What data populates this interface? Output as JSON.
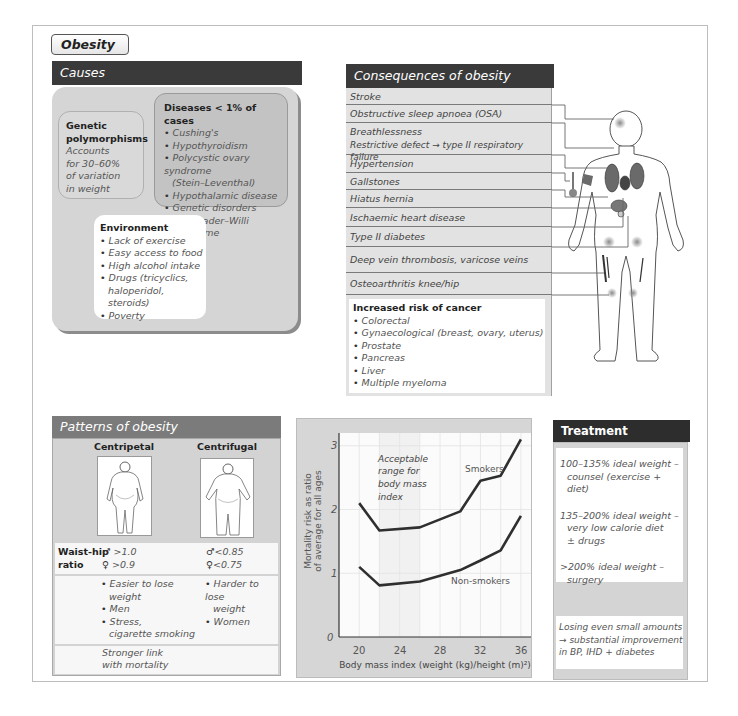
{
  "title": "Obesity",
  "causes": {
    "header": "Causes",
    "genetic": {
      "title_lines": [
        "Genetic",
        "polymorphisms"
      ],
      "body_lines": [
        "Accounts",
        "for 30–60%",
        "of variation",
        "in weight"
      ]
    },
    "diseases": {
      "title": "Diseases < 1% of cases",
      "items": [
        {
          "text": "Cushing's"
        },
        {
          "text": "Hypothyroidism"
        },
        {
          "text": "Polycystic ovary syndrome",
          "sub": "(Stein–Leventhal)"
        },
        {
          "text": "Hypothalamic disease"
        },
        {
          "text": "Genetic disorders",
          "sub": "e.g. Prader–Willi syndrome"
        }
      ]
    },
    "environment": {
      "title": "Environment",
      "items": [
        {
          "text": "Lack of exercise"
        },
        {
          "text": "Easy access to food"
        },
        {
          "text": "High alcohol intake"
        },
        {
          "text": "Drugs (tricyclics,",
          "sub": "haloperidol, steroids)"
        },
        {
          "text": "Poverty"
        }
      ]
    }
  },
  "consequences": {
    "header": "Consequences of obesity",
    "items": [
      {
        "lines": [
          "Stroke"
        ]
      },
      {
        "lines": [
          "Obstructive sleep apnoea (OSA)"
        ]
      },
      {
        "lines": [
          "Breathlessness",
          "Restrictive defect → type II respiratory failure"
        ]
      },
      {
        "lines": [
          "Hypertension"
        ]
      },
      {
        "lines": [
          "Gallstones"
        ]
      },
      {
        "lines": [
          "Hiatus hernia"
        ]
      },
      {
        "lines": [
          "Ischaemic heart disease"
        ]
      },
      {
        "lines": [
          "Type II diabetes"
        ]
      },
      {
        "lines": [
          "Deep vein thrombosis, varicose veins"
        ]
      },
      {
        "lines": [
          "Osteoarthritis knee/hip"
        ]
      }
    ],
    "cancer": {
      "title": "Increased risk of cancer",
      "items": [
        "Colorectal",
        "Gynaecological (breast, ovary, uterus)",
        "Prostate",
        "Pancreas",
        "Liver",
        "Multiple myeloma"
      ]
    }
  },
  "patterns": {
    "header": "Patterns of obesity",
    "columns": [
      "Centripetal",
      "Centrifugal"
    ],
    "ratio_label": [
      "Waist-hip",
      "ratio"
    ],
    "symbols": {
      "male": "♂",
      "female": "♀"
    },
    "centripetal": {
      "male": ">1.0",
      "female": ">0.9",
      "features": [
        {
          "text": "Easier to lose",
          "sub": "weight"
        },
        {
          "text": "Men"
        },
        {
          "text": "Stress,",
          "sub": "cigarette smoking"
        }
      ],
      "mortality": [
        "Stronger link",
        "with mortality"
      ]
    },
    "centrifugal": {
      "male": "<0.85",
      "female": "<0.75",
      "features": [
        {
          "text": "Harder to lose",
          "sub": "weight"
        },
        {
          "text": "Women"
        }
      ]
    }
  },
  "treatment": {
    "header": "Treatment",
    "items": [
      {
        "main": "100–135% ideal weight –",
        "sub": [
          "counsel (exercise + diet)"
        ]
      },
      {
        "main": "135–200% ideal weight –",
        "sub": [
          "very low calorie diet",
          "± drugs"
        ]
      },
      {
        "main": ">200% ideal weight –",
        "sub": [
          "surgery"
        ]
      }
    ],
    "note": [
      "Losing even small amounts",
      "→ substantial improvement",
      "in BP, IHD + diabetes"
    ]
  },
  "colors": {
    "header_dark": "#3a3a3a",
    "header_mid": "#7b7b7b",
    "panel_gray": "#d5d5d5",
    "line_dark": "#333333"
  },
  "chart_data": {
    "type": "line",
    "title": "",
    "x": [
      20,
      22,
      26,
      30,
      32,
      34,
      36
    ],
    "series": [
      {
        "name": "Smokers",
        "values": [
          2.1,
          1.67,
          1.72,
          1.97,
          2.45,
          2.53,
          3.1
        ]
      },
      {
        "name": "Non-smokers",
        "values": [
          1.1,
          0.81,
          0.87,
          1.05,
          1.2,
          1.36,
          1.9
        ]
      }
    ],
    "x_ticks": [
      "20",
      "24",
      "28",
      "32",
      "36"
    ],
    "y_ticks": [
      "0",
      "1",
      "2",
      "3"
    ],
    "xlabel": "Body mass index (weight (kg)/height (m)²)",
    "ylabel": [
      "Mortality risk as ratio",
      "of average for all ages"
    ],
    "xlim": [
      18,
      37
    ],
    "ylim": [
      0,
      3.2
    ],
    "grid": true,
    "shaded_band": [
      22,
      26
    ],
    "annotations": {
      "acceptable": [
        "Acceptable",
        "range for",
        "body mass",
        "index"
      ],
      "smokers": "Smokers",
      "non_smokers": "Non-smokers"
    }
  }
}
